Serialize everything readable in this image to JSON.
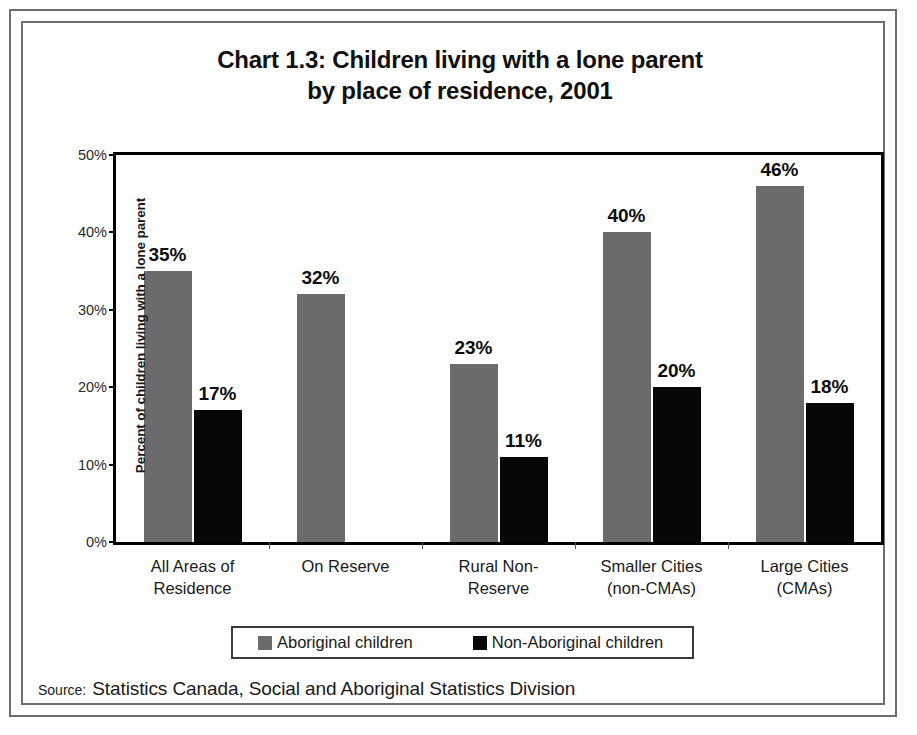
{
  "chart_data": {
    "type": "bar",
    "title": "Chart 1.3: Children living with a lone parent by place of residence, 2001",
    "title_lines": [
      "Chart 1.3: Children living with a lone parent",
      "by place of residence, 2001"
    ],
    "xlabel": "",
    "ylabel": "Percent of children living with a lone parent",
    "ylim": [
      0,
      50
    ],
    "ytick_labels": [
      "0%",
      "10%",
      "20%",
      "30%",
      "40%",
      "50%"
    ],
    "ytick_values": [
      0,
      10,
      20,
      30,
      40,
      50
    ],
    "grid": false,
    "legend_position": "bottom",
    "categories": [
      "All Areas of Residence",
      "On Reserve",
      "Rural Non-Reserve",
      "Smaller Cities (non-CMAs)",
      "Large Cities (CMAs)"
    ],
    "category_lines": [
      [
        "All Areas of",
        "Residence"
      ],
      [
        "On Reserve",
        ""
      ],
      [
        "Rural Non-",
        "Reserve"
      ],
      [
        "Smaller Cities",
        "(non-CMAs)"
      ],
      [
        "Large Cities",
        "(CMAs)"
      ]
    ],
    "series": [
      {
        "name": "Aboriginal children",
        "color": "#6b6b6b",
        "values": [
          35,
          32,
          23,
          40,
          46
        ],
        "labels": [
          "35%",
          "32%",
          "23%",
          "40%",
          "46%"
        ]
      },
      {
        "name": "Non-Aboriginal children",
        "color": "#070707",
        "values": [
          17,
          null,
          11,
          20,
          18
        ],
        "labels": [
          "17%",
          "",
          "11%",
          "20%",
          "18%"
        ]
      }
    ]
  },
  "legend": {
    "entries": [
      {
        "label": "Aboriginal children",
        "color": "#6b6b6b"
      },
      {
        "label": "Non-Aboriginal children",
        "color": "#070707"
      }
    ]
  },
  "source": {
    "label": "Source:",
    "text": "Statistics Canada, Social and Aboriginal Statistics Division"
  }
}
